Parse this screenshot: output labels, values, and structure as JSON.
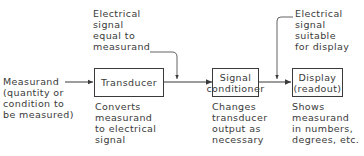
{
  "diagram": {
    "type": "block-diagram",
    "input": {
      "label": "Measurand\n(quantity or\ncondition to\nbe measured)"
    },
    "blocks": [
      {
        "id": "transducer",
        "label": "Transducer",
        "description": "Converts\nmeasurand\nto electrical\nsignal"
      },
      {
        "id": "signal_conditioner",
        "label": "Signal\nconditioner",
        "description": "Changes\ntransducer\noutput as\nnecessary"
      },
      {
        "id": "display",
        "label": "Display\n(readout)",
        "description": "Shows\nmeasurand\nin numbers,\ndegrees, etc."
      }
    ],
    "annotations": [
      {
        "id": "after_transducer",
        "label": "Electrical\nsignal\nequal to\nmeasurand"
      },
      {
        "id": "after_conditioner",
        "label": "Electrical\nsignal\nsuitable\nfor display"
      }
    ],
    "colors": {
      "line": "#3a3a3a",
      "background": "#ffffff"
    }
  }
}
